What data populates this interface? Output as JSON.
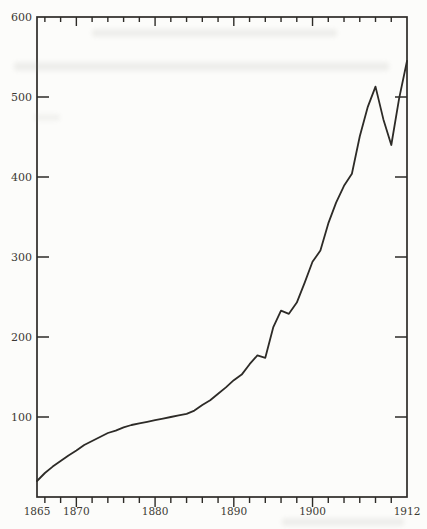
{
  "figure": {
    "background_color": "#fcfcfa",
    "ink_color": "#2d2b27",
    "label_color": "#3b3933"
  },
  "chart_data": {
    "type": "line",
    "title": "",
    "xlabel": "",
    "ylabel": "",
    "x_range": [
      1865,
      1912
    ],
    "y_range": [
      0,
      600
    ],
    "frame": "closed-box",
    "grid": false,
    "legend": null,
    "y_tick_step": 100,
    "y_tick_labels": [
      "600",
      "500",
      "400",
      "300",
      "200",
      "100"
    ],
    "y_tick_values": [
      600,
      500,
      400,
      300,
      200,
      100
    ],
    "x_tick_labels": [
      "1865",
      "1870",
      "1880",
      "1890",
      "1900",
      "1912"
    ],
    "x_tick_label_values": [
      1865,
      1870,
      1880,
      1890,
      1900,
      1912
    ],
    "x_minor_tick_step": 2,
    "x_minor_tick_start": 1866,
    "x_minor_tick_end": 1910,
    "x_major_ticks": [
      1870,
      1880,
      1890,
      1900
    ],
    "series": [
      {
        "name": "value",
        "x": [
          1865,
          1866,
          1867,
          1868,
          1869,
          1870,
          1871,
          1872,
          1873,
          1874,
          1875,
          1876,
          1877,
          1878,
          1879,
          1880,
          1881,
          1882,
          1883,
          1884,
          1885,
          1886,
          1887,
          1888,
          1889,
          1890,
          1891,
          1892,
          1893,
          1894,
          1895,
          1896,
          1897,
          1898,
          1899,
          1900,
          1901,
          1902,
          1903,
          1904,
          1905,
          1906,
          1907,
          1908,
          1909,
          1910,
          1911,
          1912
        ],
        "values": [
          20,
          30,
          38,
          45,
          52,
          58,
          65,
          70,
          75,
          80,
          83,
          87,
          90,
          92,
          94,
          96,
          98,
          100,
          102,
          104,
          108,
          115,
          121,
          129,
          137,
          146,
          153,
          166,
          177,
          174,
          212,
          233,
          229,
          243,
          268,
          294,
          308,
          342,
          368,
          389,
          404,
          451,
          487,
          513,
          472,
          440,
          498,
          545
        ]
      }
    ]
  }
}
